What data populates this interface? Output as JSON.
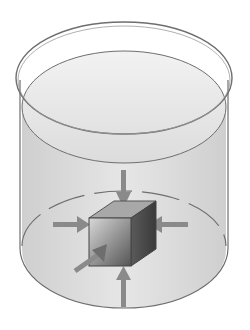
{
  "diagram": {
    "title": "",
    "colors": {
      "background": "#ffffff",
      "outline": "#6e6e6e",
      "liquid": "#d9d9d9",
      "liquid_surface": "#e8e8e8",
      "arrow": "#8a8a8a",
      "cube_front": "#8c8c8c",
      "cube_top": "#a8a8a8",
      "cube_side": "#5a5a5a"
    },
    "arrows": [
      "top",
      "bottom",
      "left",
      "right",
      "front"
    ]
  }
}
